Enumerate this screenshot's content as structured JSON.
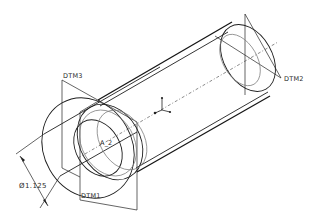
{
  "drawing": {
    "title": "Isometric view of flanged tube with datum features",
    "datum_planes": [
      {
        "id": "dtm3",
        "label": "DTM3"
      },
      {
        "id": "dtm1",
        "label": "DTM1"
      },
      {
        "id": "dtm2",
        "label": "DTM2"
      }
    ],
    "axis": {
      "label": "A_2"
    },
    "coordinate_system": {
      "icon": "csys-icon"
    },
    "dimension": {
      "type": "diameter",
      "symbol": "Ø",
      "value": "1.125",
      "text": "Ø1.125"
    },
    "colors": {
      "background": "#ffffff",
      "line": "#1e1e1e",
      "hidden": "#7a7a7a"
    }
  }
}
